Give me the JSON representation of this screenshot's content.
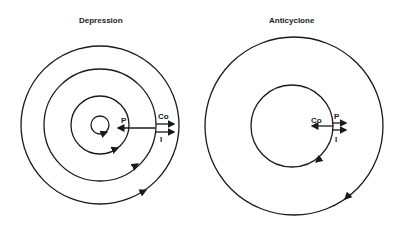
{
  "diagrams": [
    {
      "title": "Depression",
      "labels": {
        "p": "P",
        "co": "Co",
        "i": "I"
      }
    },
    {
      "title": "Anticyclone",
      "labels": {
        "p": "P",
        "co": "Co",
        "i": "I"
      }
    }
  ],
  "colors": {
    "line": "#1a1a1a",
    "background": "#ffffff"
  }
}
